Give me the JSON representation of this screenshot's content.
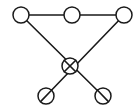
{
  "figure": {
    "background_color": "#ffffff",
    "stroke_color": "#1a1a1a",
    "node_fill_color": "#ffffff",
    "width": 139,
    "height": 111
  },
  "chart_data": {
    "type": "diagram",
    "subtype": "node-link-graph",
    "xlabel": "",
    "ylabel": "",
    "node_radius": 8,
    "node_count": 6,
    "edge_count": 5,
    "nodes": [
      {
        "id": "top-left",
        "label": "",
        "x": 21,
        "y": 15,
        "marker": "circle"
      },
      {
        "id": "top-middle",
        "label": "",
        "x": 72,
        "y": 15,
        "marker": "circle"
      },
      {
        "id": "top-right",
        "label": "",
        "x": 124,
        "y": 15,
        "marker": "circle"
      },
      {
        "id": "center",
        "label": "",
        "x": 70,
        "y": 66,
        "marker": "crossed-circle"
      },
      {
        "id": "bottom-left",
        "label": "",
        "x": 46,
        "y": 96,
        "marker": "circle"
      },
      {
        "id": "bottom-right",
        "label": "",
        "x": 103,
        "y": 96,
        "marker": "circle"
      }
    ],
    "edges": [
      {
        "id": "edge-top-horizontal",
        "from": "top-left",
        "to": "top-right",
        "style": "straight"
      },
      {
        "id": "edge-topleft-center",
        "from": "top-left",
        "to": "bottom-right",
        "style": "straight"
      },
      {
        "id": "edge-topright-center",
        "from": "top-right",
        "to": "bottom-left",
        "style": "straight"
      },
      {
        "id": "edge-center-bottomleft",
        "from": "center",
        "to": "bottom-left",
        "style": "straight"
      },
      {
        "id": "edge-center-bottomright",
        "from": "center",
        "to": "bottom-right",
        "style": "straight"
      }
    ]
  }
}
